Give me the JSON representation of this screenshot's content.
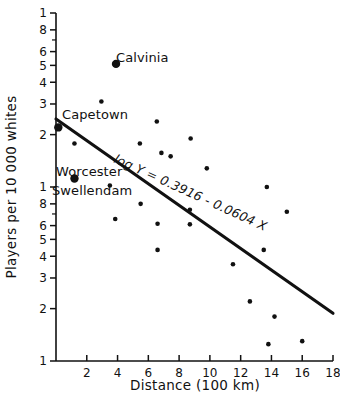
{
  "chart_data": {
    "type": "scatter",
    "title": "",
    "xlabel": "Distance  (100 km)",
    "ylabel": "Players per 10 000 whites",
    "yscale": "log",
    "xscale": "linear",
    "xlim": [
      0,
      18
    ],
    "ylim": [
      0.1,
      10
    ],
    "grid": false,
    "legend": null,
    "xticks": [
      2,
      4,
      6,
      8,
      10,
      12,
      14,
      16,
      18
    ],
    "xtick_labels": [
      "2",
      "4",
      "6",
      "8",
      "10",
      "12",
      "14",
      "16",
      "18"
    ],
    "ytick_values": [
      10,
      8,
      7,
      6,
      5,
      4,
      3,
      2,
      1,
      0.8,
      0.7,
      0.6,
      0.5,
      0.4,
      0.3,
      0.2,
      0.1
    ],
    "ytick_labels": [
      "1",
      "8",
      "",
      "6",
      "5",
      "4",
      "3",
      "2",
      "1",
      "8",
      "",
      "6",
      "5",
      "4",
      "3",
      "2",
      "1"
    ],
    "annotations": [
      {
        "text": "Calvinia",
        "x": 3.9,
        "y": 5.1
      },
      {
        "text": "Capetown",
        "x": 0.35,
        "y": 2.2
      },
      {
        "text": "Worcester",
        "x": 1.2,
        "y": 1.12
      },
      {
        "text": "Swellendam",
        "x": 3.5,
        "y": 1.02
      }
    ],
    "equation": "log Y = 0.3916 - 0.0604 X",
    "fit_line": {
      "intercept_log10": 0.3916,
      "slope_log10": -0.0604,
      "x_start": 0,
      "x_end": 18,
      "y_start": 2.46,
      "y_end": 0.188
    },
    "highlighted_points": [
      {
        "label": "Calvinia",
        "x": 3.9,
        "y": 5.1
      },
      {
        "label": "Capetown",
        "x": 0.15,
        "y": 2.2
      },
      {
        "label": "Worcester",
        "x": 1.2,
        "y": 1.12
      }
    ],
    "points": [
      {
        "x": 3.9,
        "y": 5.1
      },
      {
        "x": 2.95,
        "y": 3.1
      },
      {
        "x": 6.55,
        "y": 2.38
      },
      {
        "x": 0.15,
        "y": 2.2
      },
      {
        "x": 8.75,
        "y": 1.9
      },
      {
        "x": 1.2,
        "y": 1.78
      },
      {
        "x": 5.45,
        "y": 1.78
      },
      {
        "x": 6.85,
        "y": 1.57
      },
      {
        "x": 7.45,
        "y": 1.5
      },
      {
        "x": 9.8,
        "y": 1.28
      },
      {
        "x": 1.2,
        "y": 1.12
      },
      {
        "x": 3.5,
        "y": 1.02
      },
      {
        "x": 13.7,
        "y": 1.0
      },
      {
        "x": 5.5,
        "y": 0.8
      },
      {
        "x": 8.7,
        "y": 0.74
      },
      {
        "x": 15.0,
        "y": 0.72
      },
      {
        "x": 3.85,
        "y": 0.655
      },
      {
        "x": 6.6,
        "y": 0.615
      },
      {
        "x": 8.7,
        "y": 0.61
      },
      {
        "x": 13.5,
        "y": 0.435
      },
      {
        "x": 6.6,
        "y": 0.435
      },
      {
        "x": 11.5,
        "y": 0.36
      },
      {
        "x": 12.6,
        "y": 0.22
      },
      {
        "x": 14.2,
        "y": 0.18
      },
      {
        "x": 16.0,
        "y": 0.13
      },
      {
        "x": 13.8,
        "y": 0.125
      }
    ]
  },
  "figure": {
    "background_color": "#ffffff",
    "ink_color": "#111111"
  }
}
